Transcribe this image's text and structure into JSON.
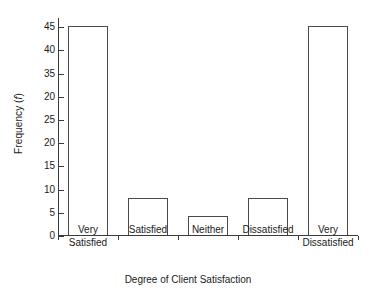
{
  "chart_data": {
    "type": "bar",
    "title": "",
    "xlabel": "Degree of Client Satisfaction",
    "ylabel_prefix": "Frequency (",
    "ylabel_italic": "f",
    "ylabel_suffix": ")",
    "categories": [
      "Very\nSatisfied",
      "Satisfied",
      "Neither",
      "Dissatisfied",
      "Very\nDissatisfied"
    ],
    "values": [
      45,
      8,
      4,
      8,
      45
    ],
    "ylim": [
      0,
      47
    ],
    "ytick_values": [
      0,
      5,
      10,
      15,
      20,
      25,
      30,
      35,
      40,
      45
    ],
    "ytick_labels": [
      "0",
      "5",
      "10",
      "15",
      "20",
      "25",
      "20",
      "35",
      "40",
      "45"
    ],
    "grid": false,
    "legend": "none",
    "bar_fill": "#ffffff",
    "bar_edge": "#4a4a4a",
    "axis_color": "#3b3b3b",
    "background": "#ffffff"
  }
}
